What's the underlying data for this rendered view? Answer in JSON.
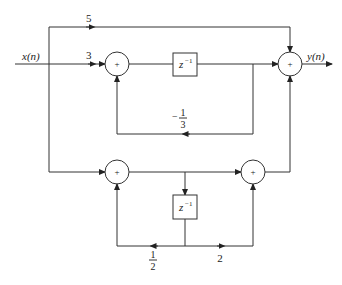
{
  "diagram": {
    "type": "signal-flow block diagram",
    "input_label": "x(n)",
    "output_label": "y(n)",
    "adder_symbol": "+",
    "delay_label": {
      "base": "z",
      "exp": "−1"
    },
    "gains": {
      "top_bypass": "5",
      "upper_input": "3",
      "upper_feedback_sign": "−",
      "upper_feedback_num": "1",
      "upper_feedback_den": "3",
      "lower_feedback_num": "1",
      "lower_feedback_den": "2",
      "lower_feedforward": "2"
    }
  }
}
